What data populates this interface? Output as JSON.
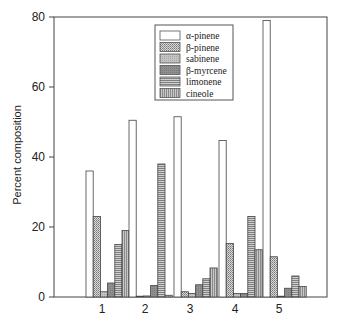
{
  "chart_data": {
    "type": "bar",
    "title": "",
    "xlabel": "",
    "ylabel": "Percent composition",
    "ylim": [
      0,
      80
    ],
    "yticks": [
      0,
      20,
      40,
      60,
      80
    ],
    "categories": [
      "1",
      "2",
      "3",
      "4",
      "5"
    ],
    "legend_position": "upper center (inside plot)",
    "grid": false,
    "series": [
      {
        "name": "α-pinene",
        "pattern": "white",
        "values": [
          36,
          50.5,
          51.5,
          44.7,
          79
        ]
      },
      {
        "name": "β-pinene",
        "pattern": "dense-dots",
        "values": [
          23,
          0.2,
          1.5,
          15.3,
          11.5
        ]
      },
      {
        "name": "sabinene",
        "pattern": "light-gray",
        "values": [
          1.5,
          0.3,
          1,
          1,
          0.2
        ]
      },
      {
        "name": "β-myrcene",
        "pattern": "dark-gray",
        "values": [
          4,
          3.3,
          3.5,
          1,
          2.5
        ]
      },
      {
        "name": "limonene",
        "pattern": "horizontal",
        "values": [
          15,
          38,
          5.2,
          23,
          6
        ]
      },
      {
        "name": "cineole",
        "pattern": "vertical",
        "values": [
          19,
          0.5,
          8.3,
          13.5,
          3
        ]
      }
    ]
  }
}
